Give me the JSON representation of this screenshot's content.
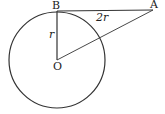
{
  "diagram": {
    "type": "geometry-tangent",
    "points": {
      "B": {
        "label": "B",
        "x": 57,
        "y": 11
      },
      "A": {
        "label": "A",
        "x": 153,
        "y": 10
      },
      "O": {
        "label": "O",
        "x": 57,
        "y": 60
      }
    },
    "circle": {
      "cx": 57,
      "cy": 60,
      "r": 48
    },
    "segments": [
      {
        "from": "B",
        "to": "A",
        "label": "2r"
      },
      {
        "from": "B",
        "to": "O",
        "label": "r"
      },
      {
        "from": "O",
        "to": "A",
        "label": ""
      }
    ],
    "labels": {
      "B": "B",
      "A": "A",
      "O": "O",
      "BA": "2r",
      "BO": "r"
    },
    "colors": {
      "stroke": "#333333",
      "text": "#222222",
      "background": "#ffffff"
    }
  }
}
